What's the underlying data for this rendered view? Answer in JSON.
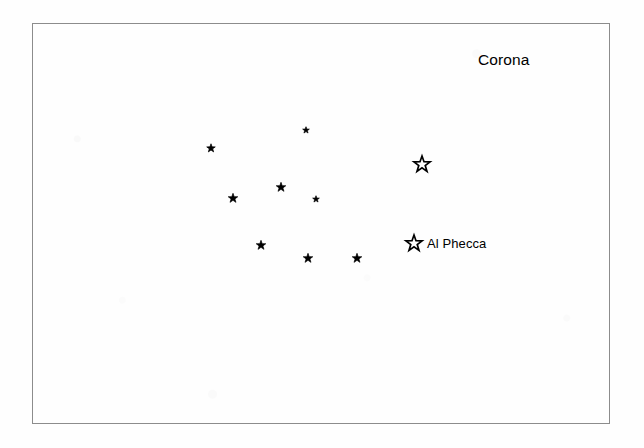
{
  "figure": {
    "kind": "star-chart",
    "width": 644,
    "height": 448,
    "background_color": "#fefefe",
    "frame": {
      "x": 32,
      "y": 23,
      "width": 578,
      "height": 401,
      "border_color": "#8c8c8c",
      "border_width": 1
    }
  },
  "labels": {
    "constellation_title": {
      "text": "Corona",
      "x": 478,
      "y": 52,
      "font_size": 15.5,
      "color": "#000000"
    },
    "named_star": {
      "text": "Al Phecca",
      "x": 427,
      "y": 237,
      "font_size": 13,
      "color": "#000000"
    }
  },
  "stars": [
    {
      "name": "star-small-upper",
      "x": 306,
      "y": 130,
      "size": 7,
      "style": "filled",
      "color": "#000000"
    },
    {
      "name": "star-upper-left",
      "x": 211,
      "y": 148,
      "size": 9,
      "style": "filled",
      "color": "#000000"
    },
    {
      "name": "star-bright-upper-right",
      "x": 422,
      "y": 164,
      "size": 17,
      "style": "outline",
      "color": "#000000"
    },
    {
      "name": "star-mid-center",
      "x": 281,
      "y": 187,
      "size": 10,
      "style": "filled",
      "color": "#000000"
    },
    {
      "name": "star-mid-left",
      "x": 233,
      "y": 198,
      "size": 10,
      "style": "filled",
      "color": "#000000"
    },
    {
      "name": "star-small-mid-right",
      "x": 316,
      "y": 199,
      "size": 7,
      "style": "filled",
      "color": "#000000"
    },
    {
      "name": "star-al-phecca",
      "x": 414,
      "y": 243,
      "size": 17,
      "style": "outline",
      "color": "#000000"
    },
    {
      "name": "star-lower-left",
      "x": 261,
      "y": 245,
      "size": 10,
      "style": "filled",
      "color": "#000000"
    },
    {
      "name": "star-lower-center",
      "x": 308,
      "y": 258,
      "size": 10,
      "style": "filled",
      "color": "#000000"
    },
    {
      "name": "star-lower-right",
      "x": 357,
      "y": 258,
      "size": 10,
      "style": "filled",
      "color": "#000000"
    }
  ]
}
